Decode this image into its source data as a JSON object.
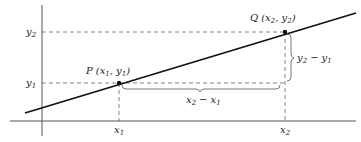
{
  "diagram": {
    "type": "slope-two-points",
    "axes": {
      "x_axis": "horizontal",
      "y_axis": "vertical"
    },
    "points": [
      {
        "id": "P",
        "label": "P",
        "coords_label": "(x1, y1)",
        "x_label": "x1",
        "y_label": "y1"
      },
      {
        "id": "Q",
        "label": "Q",
        "coords_label": "(x2, y2)",
        "x_label": "x2",
        "y_label": "y2"
      }
    ],
    "tick_labels": {
      "x1": {
        "base": "x",
        "sub": "1"
      },
      "x2": {
        "base": "x",
        "sub": "2"
      },
      "y1": {
        "base": "y",
        "sub": "1"
      },
      "y2": {
        "base": "y",
        "sub": "2"
      }
    },
    "point_labels": {
      "P": {
        "name": "P",
        "a": "x",
        "a_sub": "1",
        "b": "y",
        "b_sub": "1"
      },
      "Q": {
        "name": "Q",
        "a": "x",
        "a_sub": "2",
        "b": "y",
        "b_sub": "2"
      }
    },
    "braces": {
      "run": {
        "a": "x",
        "a_sub": "2",
        "op": "−",
        "b": "x",
        "b_sub": "1"
      },
      "rise": {
        "a": "y",
        "a_sub": "2",
        "op": "−",
        "b": "y",
        "b_sub": "1"
      }
    },
    "colors": {
      "ink": "#222222",
      "dashes": "#555555",
      "background": "#ffffff"
    }
  }
}
